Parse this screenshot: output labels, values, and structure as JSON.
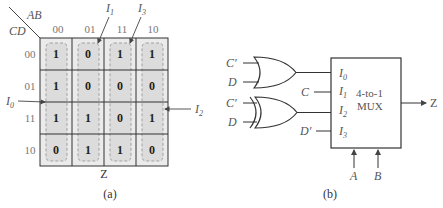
{
  "kmap": {
    "row_var": "CD",
    "col_var": "AB",
    "col_headers": [
      "00",
      "01",
      "11",
      "10"
    ],
    "row_headers": [
      "00",
      "01",
      "11",
      "10"
    ],
    "cells": [
      [
        "1",
        "0",
        "1",
        "1"
      ],
      [
        "1",
        "0",
        "0",
        "0"
      ],
      [
        "1",
        "1",
        "0",
        "1"
      ],
      [
        "0",
        "1",
        "1",
        "0"
      ]
    ],
    "input_labels": {
      "i0": "I",
      "i0_sub": "0",
      "i1": "I",
      "i1_sub": "1",
      "i2": "I",
      "i2_sub": "2",
      "i3": "I",
      "i3_sub": "3"
    },
    "output_label": "Z",
    "caption": "(a)"
  },
  "circuit": {
    "gate1": {
      "type": "OR",
      "inputs": [
        "C′",
        "D"
      ]
    },
    "gate2": {
      "type": "XOR",
      "inputs": [
        "C′",
        "D"
      ]
    },
    "mux": {
      "title_line1": "4-to-1",
      "title_line2": "MUX",
      "inputs": [
        {
          "name": "I",
          "sub": "0",
          "source": ""
        },
        {
          "name": "I",
          "sub": "1",
          "source": "C"
        },
        {
          "name": "I",
          "sub": "2",
          "source": ""
        },
        {
          "name": "I",
          "sub": "3",
          "source": "D′"
        }
      ],
      "selects": [
        "A",
        "B"
      ],
      "output": "Z"
    },
    "caption": "(b)"
  },
  "colors": {
    "grid_line": "#333333",
    "cell_fill": "#e6e6e6",
    "dash": "#999999",
    "text": "#555555"
  }
}
